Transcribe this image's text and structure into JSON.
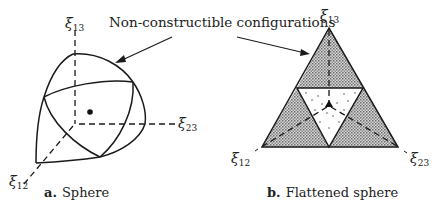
{
  "annotation": {
    "text": "Non-constructible configurations"
  },
  "panel_a": {
    "caption_letter": "a.",
    "caption_text": "Sphere",
    "axes": {
      "x13": {
        "symbol": "ξ",
        "subscript": "13"
      },
      "x23": {
        "symbol": "ξ",
        "subscript": "23"
      },
      "x12": {
        "symbol": "ξ",
        "subscript": "12"
      }
    }
  },
  "panel_b": {
    "caption_letter": "b.",
    "caption_text": "Flattened sphere",
    "axes": {
      "x13": {
        "symbol": "ξ",
        "subscript": "13"
      },
      "x23": {
        "symbol": "ξ",
        "subscript": "23"
      },
      "x12": {
        "symbol": "ξ",
        "subscript": "12"
      }
    }
  },
  "colors": {
    "line": "#1a1a1a",
    "hatch_fill": "#b8b8b8",
    "background": "#ffffff"
  }
}
